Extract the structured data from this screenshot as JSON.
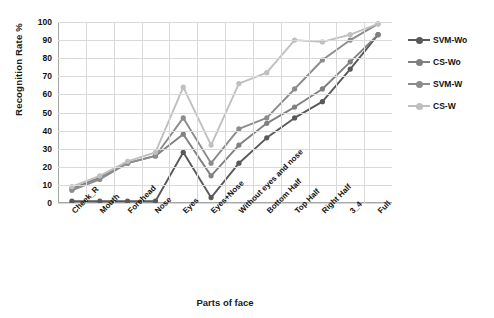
{
  "chart_data": {
    "type": "line",
    "title": "",
    "xlabel": "Parts of face",
    "ylabel": "Recognition Rate %",
    "ylim": [
      0,
      100
    ],
    "ytick_step": 10,
    "yticks": [
      0,
      10,
      20,
      30,
      40,
      50,
      60,
      70,
      80,
      90,
      100
    ],
    "grid": true,
    "legend_position": "right",
    "categories": [
      "Cheek_R",
      "Mouth",
      "Forehead",
      "Nose",
      "Eyes",
      "Eyes+Nose",
      "Without eyes and nose",
      "Bottom Half",
      "Top Half",
      "Right Half",
      "3_4",
      "Full"
    ],
    "series": [
      {
        "name": "SVM-Wo",
        "color": "#595959",
        "values": [
          1,
          1,
          1,
          1,
          28,
          3,
          22,
          36,
          47,
          56,
          74,
          93
        ]
      },
      {
        "name": "CS-Wo",
        "color": "#808080",
        "values": [
          8,
          14,
          22,
          26,
          38,
          15,
          32,
          44,
          53,
          63,
          78,
          93
        ]
      },
      {
        "name": "SVM-W",
        "color": "#8c8c8c",
        "values": [
          7,
          13,
          22,
          26,
          47,
          22,
          41,
          47,
          63,
          79,
          90,
          99
        ]
      },
      {
        "name": "CS-W",
        "color": "#bfbfbf",
        "values": [
          9,
          15,
          23,
          28,
          64,
          32,
          66,
          72,
          90,
          89,
          93,
          99
        ]
      }
    ]
  },
  "axis": {
    "ytitle": "Recognition Rate %",
    "xtitle": "Parts of face"
  },
  "legend": {
    "items": [
      {
        "label": "SVM-Wo",
        "color": "#595959"
      },
      {
        "label": "CS-Wo",
        "color": "#808080"
      },
      {
        "label": "SVM-W",
        "color": "#8c8c8c"
      },
      {
        "label": "CS-W",
        "color": "#bfbfbf"
      }
    ]
  }
}
